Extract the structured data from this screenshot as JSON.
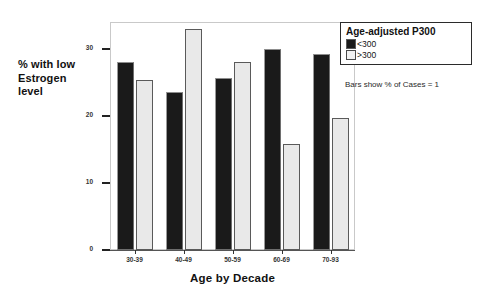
{
  "chart_data": {
    "type": "bar",
    "title": "",
    "xlabel": "Age by Decade",
    "ylabel": "% with low Estrogen level",
    "ylabel_lines": [
      "% with low",
      "Estrogen",
      "level"
    ],
    "categories": [
      "30-39",
      "40-49",
      "50-59",
      "60-69",
      "70-93"
    ],
    "series": [
      {
        "name": "<300",
        "color": "#1a1a1a",
        "values": [
          28,
          23.5,
          25.7,
          30,
          29.3
        ]
      },
      {
        "name": ">300",
        "color": "#e9e9e9",
        "values": [
          25.3,
          33,
          28,
          15.8,
          19.7
        ]
      }
    ],
    "ylim": [
      0,
      34
    ],
    "yticks": [
      0,
      10,
      20,
      30
    ],
    "ytick_labels": [
      "0",
      "10",
      "20",
      "30"
    ],
    "grid": false,
    "legend_position": "top-right",
    "legend_title": "Age-adjusted P300",
    "annotation": "Bars show % of Cases = 1"
  },
  "legend": {
    "title": "Age-adjusted P300",
    "entries": [
      {
        "label": "<300",
        "swatch": "dark"
      },
      {
        "label": ">300",
        "swatch": "light"
      }
    ]
  },
  "footnote": {
    "text": "Bars show % of Cases = 1"
  },
  "axes": {
    "y_title_lines": [
      "% with low",
      "Estrogen",
      "level"
    ],
    "x_title": "Age by Decade"
  }
}
